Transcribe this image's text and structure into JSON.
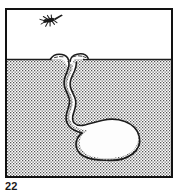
{
  "figure": {
    "number_label": "22",
    "panel": {
      "width": 168,
      "height": 170,
      "border_color": "#121212",
      "border_width": 2,
      "background_color": "#ffffff"
    },
    "layers": [
      {
        "name": "water-column",
        "label": "water",
        "fill": "#ffffff",
        "top": 0,
        "bottom": 49
      },
      {
        "name": "sediment",
        "label": "sediment",
        "fill_pattern": "stipple-dots",
        "dot_color": "#4a4a4a",
        "base_color": "#ffffff",
        "top": 49,
        "bottom": 166
      }
    ],
    "sediment_surface": {
      "name": "sediment-water-interface",
      "y": 49,
      "line_color": "#1c1c1c",
      "line_width": 1.2
    },
    "burrow": {
      "name": "u-shaped-burrow",
      "fill": "#fcfcfc",
      "outline_color": "#1c1c1c",
      "outline_width": 1.6,
      "openings": [
        {
          "name": "left-burrow-opening",
          "x": 52,
          "y": 49
        },
        {
          "name": "right-burrow-opening",
          "x": 68,
          "y": 49
        }
      ],
      "chamber": {
        "name": "burrow-chamber",
        "center_x": 100,
        "center_y": 128,
        "radius_x": 32,
        "radius_y": 20
      }
    },
    "organism": {
      "name": "swimming-organism",
      "x": 38,
      "y": 15,
      "color": "#1c1c1c",
      "description": "small dark swimming organism with outstretched appendages"
    }
  },
  "colors": {
    "ink": "#1c1c1c",
    "border": "#121212",
    "stipple": "#4a4a4a",
    "paper": "#ffffff"
  }
}
